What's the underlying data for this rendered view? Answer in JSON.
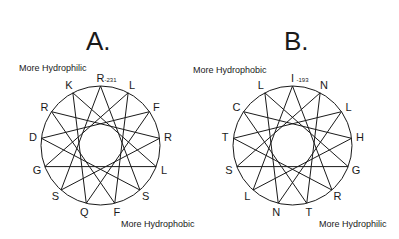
{
  "panels": [
    {
      "id": "A",
      "title": "A.",
      "top_note": "More Hydrophilic",
      "bottom_note": "More Hydrophobic",
      "start_number": "-231",
      "residues_clockwise_from_top": [
        "R",
        "L",
        "F",
        "R",
        "L",
        "S",
        "F",
        "Q",
        "S",
        "G",
        "D",
        "R",
        "K"
      ]
    },
    {
      "id": "B",
      "title": "B.",
      "top_note": "More Hydrophobic",
      "bottom_note": "More Hydrophilic",
      "start_number": "-193",
      "residues_clockwise_from_top": [
        "I",
        "N",
        "L",
        "H",
        "G",
        "R",
        "T",
        "N",
        "L",
        "S",
        "T",
        "C",
        "L"
      ]
    }
  ],
  "colors": {
    "ink": "#1a1a1a",
    "background": "#ffffff"
  }
}
